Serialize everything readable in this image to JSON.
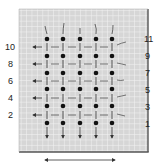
{
  "diagram": {
    "title": "",
    "colors": {
      "background": "#ffffff",
      "grid_fill": "#d9d9d9",
      "grid_lines": "#f2f2f2",
      "border": "#555555",
      "dot": "#111111",
      "ink": "#333333"
    },
    "grid": {
      "columns": 5,
      "rows": 6
    },
    "left_row_labels": [
      "10",
      "8",
      "6",
      "4",
      "2"
    ],
    "right_row_labels": [
      "11",
      "9",
      "7",
      "5",
      "3",
      "1"
    ],
    "bottom_arrow": "double-headed-horizontal-arrow",
    "left_arrows": "arrows pointing left on even rows",
    "bottom_column_arrows": "arrows pointing down below each column"
  }
}
